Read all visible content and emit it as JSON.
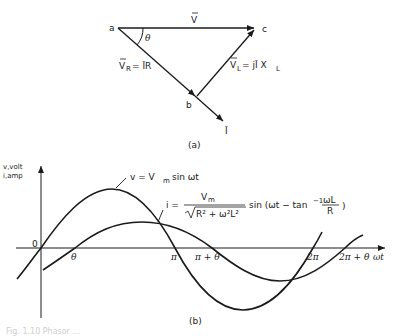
{
  "phasor_diagram": {
    "points": {
      "a": "a",
      "b": "b",
      "c": "c"
    },
    "angle_label": "θ",
    "v_label": "V",
    "vr_label_left": "V",
    "vr_sub": "R",
    "vr_eq": "= ĪR",
    "vl_label": "V",
    "vl_sub": "L",
    "vl_eq": "= jĪ X",
    "vl_eq_sub": "L",
    "i_label": "Ī",
    "caption": "(a)"
  },
  "waveform_plot": {
    "y_axis_label_line1": "v,volt",
    "y_axis_label_line2": "i,amp",
    "origin_label": "0",
    "x_axis_label": "ωt",
    "x_ticks": [
      "θ",
      "π",
      "π + θ",
      "2π",
      "2π + θ"
    ],
    "v_equation": "v = V",
    "v_equation_sub": "m",
    "v_equation_rest": "sin ωt",
    "i_equation_lhs": "i =",
    "i_numerator": "V",
    "i_numerator_sub": "m",
    "i_denominator": "R² + ω²L²",
    "i_rest": "sin (ωt − tan",
    "i_inv": "−1",
    "i_frac_num": "ωL",
    "i_frac_den": "R",
    "i_close": ")",
    "caption": "(b)"
  },
  "figure_caption": "Fig. 1.10 Phasor ..."
}
